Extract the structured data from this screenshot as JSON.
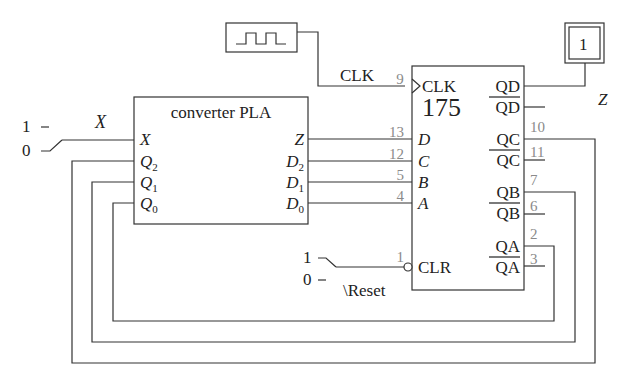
{
  "clock_source": {
    "name": "clock-generator",
    "wave_icon": "square-wave-icon"
  },
  "clock_wire_label": "CLK",
  "output_indicator": {
    "value": "1",
    "label": "Z"
  },
  "x_input": {
    "label": "X",
    "switch_high": "1",
    "switch_low": "0",
    "position": "low"
  },
  "pla": {
    "title": "converter PLA",
    "inputs": [
      {
        "name": "X",
        "sub": ""
      },
      {
        "name": "Q",
        "sub": "2"
      },
      {
        "name": "Q",
        "sub": "1"
      },
      {
        "name": "Q",
        "sub": "0"
      }
    ],
    "outputs": [
      {
        "name": "Z",
        "sub": ""
      },
      {
        "name": "D",
        "sub": "2"
      },
      {
        "name": "D",
        "sub": "1"
      },
      {
        "name": "D",
        "sub": "0"
      }
    ]
  },
  "register": {
    "part": "175",
    "clock_label": "CLK",
    "clock_pin": "9",
    "clear_label": "CLR",
    "clear_pin": "1",
    "inputs": [
      {
        "label": "D",
        "pin": "13"
      },
      {
        "label": "C",
        "pin": "12"
      },
      {
        "label": "B",
        "pin": "5"
      },
      {
        "label": "A",
        "pin": "4"
      }
    ],
    "outputs": [
      {
        "label": "QD",
        "bar_label": "QD",
        "pin": "",
        "bar_pin": ""
      },
      {
        "label": "QC",
        "bar_label": "QC",
        "pin": "10",
        "bar_pin": "11"
      },
      {
        "label": "QB",
        "bar_label": "QB",
        "pin": "7",
        "bar_pin": "6"
      },
      {
        "label": "QA",
        "bar_label": "QA",
        "pin": "2",
        "bar_pin": "3"
      }
    ]
  },
  "reset_input": {
    "label": "\\Reset",
    "switch_high": "1",
    "switch_low": "0",
    "position": "high"
  }
}
